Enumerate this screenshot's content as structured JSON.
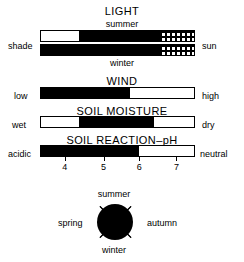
{
  "figure": {
    "title_light": "LIGHT",
    "title_wind": "WIND",
    "title_soil_moisture": "SOIL MOISTURE",
    "title_soil_reaction": "SOIL REACTION–pH"
  },
  "light": {
    "heading": "LIGHT",
    "top_caption": "summer",
    "bottom_caption": "winter",
    "left_label": "shade",
    "right_label": "sun",
    "summer_segments": [
      {
        "fill": "white",
        "percent": 25
      },
      {
        "fill": "black",
        "percent": 53
      },
      {
        "fill": "dotted",
        "percent": 22
      }
    ],
    "winter_segments": [
      {
        "fill": "black",
        "percent": 78
      },
      {
        "fill": "dotted",
        "percent": 22
      }
    ]
  },
  "wind": {
    "heading": "WIND",
    "left_label": "low",
    "right_label": "high",
    "segments": [
      {
        "fill": "black",
        "percent": 58
      },
      {
        "fill": "white",
        "percent": 42
      }
    ]
  },
  "soil_moisture": {
    "heading": "SOIL MOISTURE",
    "left_label": "wet",
    "right_label": "dry",
    "segments": [
      {
        "fill": "white",
        "percent": 25
      },
      {
        "fill": "black",
        "percent": 49
      },
      {
        "fill": "white",
        "percent": 26
      }
    ]
  },
  "soil_reaction": {
    "heading": "SOIL REACTION–pH",
    "left_label": "acidic",
    "right_label": "neutral",
    "segments": [
      {
        "fill": "black",
        "percent": 64
      },
      {
        "fill": "white",
        "percent": 36
      }
    ],
    "ticks": [
      {
        "label": "4",
        "percent": 16
      },
      {
        "label": "5",
        "percent": 41
      },
      {
        "label": "6",
        "percent": 64
      },
      {
        "label": "7",
        "percent": 88
      }
    ]
  },
  "season_circle": {
    "top_label": "summer",
    "bottom_label": "winter",
    "left_label": "spring",
    "right_label": "autumn",
    "fill_color": "#000000",
    "fill_fraction": "full"
  },
  "chart_data": {
    "type": "bar",
    "charts": [
      {
        "name": "LIGHT",
        "rows": [
          {
            "row_label": "summer",
            "axis_left": "shade",
            "axis_right": "sun",
            "segments": [
              {
                "fill": "white",
                "percent": 25
              },
              {
                "fill": "black",
                "percent": 53
              },
              {
                "fill": "dotted",
                "percent": 22
              }
            ]
          },
          {
            "row_label": "winter",
            "axis_left": "shade",
            "axis_right": "sun",
            "segments": [
              {
                "fill": "black",
                "percent": 78
              },
              {
                "fill": "dotted",
                "percent": 22
              }
            ]
          }
        ]
      },
      {
        "name": "WIND",
        "rows": [
          {
            "row_label": "",
            "axis_left": "low",
            "axis_right": "high",
            "segments": [
              {
                "fill": "black",
                "percent": 58
              },
              {
                "fill": "white",
                "percent": 42
              }
            ]
          }
        ]
      },
      {
        "name": "SOIL MOISTURE",
        "rows": [
          {
            "row_label": "",
            "axis_left": "wet",
            "axis_right": "dry",
            "segments": [
              {
                "fill": "white",
                "percent": 25
              },
              {
                "fill": "black",
                "percent": 49
              },
              {
                "fill": "white",
                "percent": 26
              }
            ]
          }
        ]
      },
      {
        "name": "SOIL REACTION–pH",
        "rows": [
          {
            "row_label": "",
            "axis_left": "acidic",
            "axis_right": "neutral",
            "segments": [
              {
                "fill": "black",
                "percent": 64
              },
              {
                "fill": "white",
                "percent": 36
              }
            ],
            "tick_labels": [
              "4",
              "5",
              "6",
              "7"
            ],
            "tick_percents": [
              16,
              41,
              64,
              88
            ]
          }
        ]
      },
      {
        "name": "season circle",
        "type": "pie",
        "labels": [
          "summer",
          "autumn",
          "winter",
          "spring"
        ],
        "values": [
          25,
          25,
          25,
          25
        ],
        "fill": "black"
      }
    ]
  }
}
